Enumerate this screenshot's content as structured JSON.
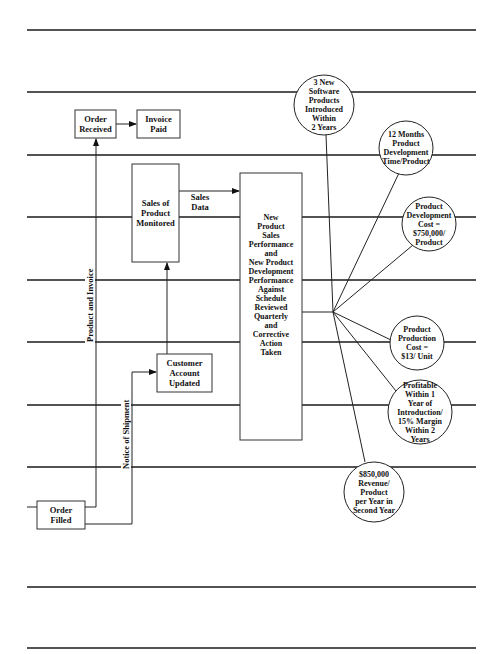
{
  "diagram": {
    "type": "process-flow-with-performance-measures",
    "process_boxes": [
      {
        "id": "order_received",
        "label": "Order\nReceived"
      },
      {
        "id": "invoice_paid",
        "label": "Invoice\nPaid"
      },
      {
        "id": "sales_monitored",
        "label": "Sales of\nProduct\nMonitored"
      },
      {
        "id": "performance_review",
        "label": "New\nProduct\nSales\nPerformance\nand\nNew Product\nDevelopment\nPerformance\nAgainst\nSchedule\nReviewed\nQuarterly\nand\nCorrective\nAction\nTaken"
      },
      {
        "id": "customer_account",
        "label": "Customer\nAccount\nUpdated"
      },
      {
        "id": "order_filled",
        "label": "Order\nFilled"
      }
    ],
    "flow_labels": {
      "sales_data": "Sales\nData",
      "product_and_invoice": "Product and Invoice",
      "notice_of_shipment": "Notice of Shipment"
    },
    "goals": [
      {
        "id": "goal_new_products",
        "label": "3 New\nSoftware\nProducts\nIntroduced\nWithin\n2 Years"
      },
      {
        "id": "goal_dev_time",
        "label": "12 Months\nProduct\nDevelopment\nTime/Product"
      },
      {
        "id": "goal_dev_cost",
        "label": "Product\nDevelopment\nCost =\n$750,000/\nProduct"
      },
      {
        "id": "goal_prod_cost",
        "label": "Product\nProduction\nCost =\n$13/ Unit"
      },
      {
        "id": "goal_profitable",
        "label": "Profitable\nWithin 1\nYear of\nIntroduction/\n15% Margin\nWithin 2\nYears"
      },
      {
        "id": "goal_revenue",
        "label": "$850,000\nRevenue/\nProduct\nper Year in\nSecond Year"
      }
    ],
    "edges": [
      {
        "from": "order_received",
        "to": "invoice_paid"
      },
      {
        "from": "order_filled",
        "to": "order_received",
        "label": "Product and Invoice"
      },
      {
        "from": "order_filled",
        "to": "customer_account",
        "label": "Notice of Shipment"
      },
      {
        "from": "customer_account",
        "to": "sales_monitored"
      },
      {
        "from": "sales_monitored",
        "to": "performance_review",
        "label": "Sales Data"
      }
    ],
    "colors": {
      "line": "#1a1a1a",
      "background": "#ffffff"
    }
  }
}
